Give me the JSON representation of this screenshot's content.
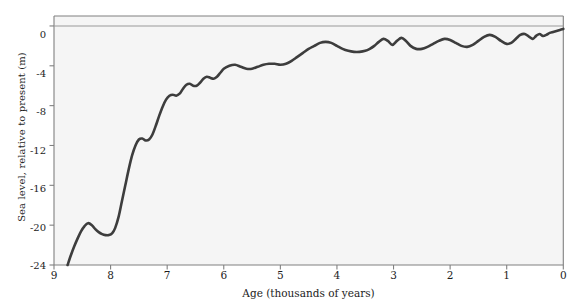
{
  "chart_data": {
    "type": "line",
    "title": "",
    "subtitle": "",
    "xlabel": "Age (thousands of years)",
    "ylabel": "Sea level, relative to present (m)",
    "xlim": [
      9,
      0
    ],
    "ylim": [
      -24,
      1
    ],
    "x_ticks": [
      9,
      8,
      7,
      6,
      5,
      4,
      3,
      2,
      1,
      0
    ],
    "x_tick_labels": [
      "9",
      "8",
      "7",
      "6",
      "5",
      "4",
      "3",
      "2",
      "1",
      "0"
    ],
    "y_ticks": [
      0,
      -4,
      -8,
      -12,
      -16,
      -20,
      -24
    ],
    "y_tick_labels": [
      "0",
      "-4",
      "-8",
      "-12",
      "-16",
      "-20",
      "-24"
    ],
    "x_units": "thousands of years before present",
    "y_units": "metres",
    "x_axis_direction": "reversed (oldest at left)",
    "grid": false,
    "legend": false,
    "reference_lines": [
      {
        "axis": "y",
        "value": 0,
        "label": "present sea level",
        "color": "#9a9a9a"
      }
    ],
    "series": [
      {
        "name": "Sea level relative to present",
        "color": "#3d3d3d",
        "line_width": 2.6,
        "x": [
          8.76,
          8.7,
          8.64,
          8.58,
          8.52,
          8.46,
          8.4,
          8.33,
          8.27,
          8.21,
          8.15,
          8.09,
          8.03,
          7.97,
          7.92,
          7.86,
          7.8,
          7.74,
          7.68,
          7.62,
          7.56,
          7.5,
          7.44,
          7.38,
          7.32,
          7.26,
          7.2,
          7.14,
          7.08,
          7.02,
          6.96,
          6.9,
          6.84,
          6.78,
          6.72,
          6.66,
          6.6,
          6.54,
          6.48,
          6.42,
          6.36,
          6.3,
          6.24,
          6.18,
          6.12,
          6.06,
          6.0,
          5.9,
          5.8,
          5.7,
          5.6,
          5.5,
          5.4,
          5.3,
          5.2,
          5.1,
          5.0,
          4.9,
          4.8,
          4.7,
          4.6,
          4.5,
          4.4,
          4.3,
          4.2,
          4.1,
          4.0,
          3.9,
          3.8,
          3.7,
          3.6,
          3.5,
          3.42,
          3.34,
          3.26,
          3.18,
          3.1,
          3.02,
          2.94,
          2.86,
          2.78,
          2.7,
          2.6,
          2.5,
          2.4,
          2.3,
          2.2,
          2.1,
          2.0,
          1.9,
          1.8,
          1.7,
          1.6,
          1.5,
          1.4,
          1.3,
          1.2,
          1.1,
          1.0,
          0.92,
          0.84,
          0.76,
          0.68,
          0.6,
          0.54,
          0.48,
          0.42,
          0.36,
          0.3,
          0.24,
          0.18,
          0.12,
          0.06,
          0.0
        ],
        "y": [
          -24.0,
          -23.0,
          -22.1,
          -21.3,
          -20.6,
          -20.1,
          -19.8,
          -20.0,
          -20.4,
          -20.7,
          -20.9,
          -21.0,
          -21.0,
          -20.8,
          -20.3,
          -19.2,
          -17.6,
          -16.0,
          -14.4,
          -13.0,
          -12.0,
          -11.4,
          -11.3,
          -11.5,
          -11.4,
          -10.9,
          -10.0,
          -9.0,
          -8.1,
          -7.4,
          -7.0,
          -6.9,
          -7.0,
          -6.8,
          -6.3,
          -5.9,
          -5.8,
          -6.0,
          -6.0,
          -5.7,
          -5.3,
          -5.1,
          -5.2,
          -5.3,
          -5.1,
          -4.7,
          -4.3,
          -4.0,
          -3.9,
          -4.1,
          -4.3,
          -4.3,
          -4.1,
          -3.9,
          -3.8,
          -3.8,
          -3.9,
          -3.8,
          -3.5,
          -3.1,
          -2.7,
          -2.3,
          -2.0,
          -1.7,
          -1.6,
          -1.7,
          -2.0,
          -2.3,
          -2.5,
          -2.6,
          -2.6,
          -2.5,
          -2.3,
          -2.0,
          -1.6,
          -1.3,
          -1.5,
          -1.9,
          -1.5,
          -1.2,
          -1.5,
          -2.0,
          -2.3,
          -2.3,
          -2.1,
          -1.8,
          -1.5,
          -1.3,
          -1.4,
          -1.7,
          -2.0,
          -2.1,
          -1.9,
          -1.5,
          -1.1,
          -0.9,
          -1.1,
          -1.5,
          -1.8,
          -1.7,
          -1.3,
          -0.9,
          -0.8,
          -1.1,
          -1.3,
          -1.0,
          -0.8,
          -1.0,
          -0.9,
          -0.7,
          -0.6,
          -0.5,
          -0.4,
          -0.3
        ],
        "notable_features": [
          {
            "age": 8.76,
            "level": -24.0,
            "note": "lowest plotted sea level at left edge of record"
          },
          {
            "age": 8.42,
            "level": -19.8,
            "note": "local high before brief reversal"
          },
          {
            "age": 8.1,
            "level": -21.0,
            "note": "meltwater-pulse plateau / slight fall"
          },
          {
            "age": 7.5,
            "level": -11.4,
            "note": "end of very rapid rise"
          },
          {
            "age": 6.9,
            "level": -6.9,
            "note": "step"
          },
          {
            "age": 4.2,
            "level": -1.6,
            "note": "mid-Holocene highstand approach"
          },
          {
            "age": 3.18,
            "level": -1.3,
            "note": "oscillation peak"
          },
          {
            "age": 2.86,
            "level": -1.2,
            "note": "oscillation peak"
          },
          {
            "age": 1.3,
            "level": -0.9,
            "note": "oscillation peak"
          },
          {
            "age": 0.68,
            "level": -0.8,
            "note": "oscillation peak"
          },
          {
            "age": 0.0,
            "level": -0.3,
            "note": "present day"
          }
        ]
      }
    ],
    "style": {
      "plot_background": "#f5f5f5",
      "page_background": "#ffffff",
      "axis_color": "#808080",
      "curve_color": "#3d3d3d",
      "zero_line_color": "#9a9a9a",
      "tick_text_color": "#1c1c1c"
    }
  }
}
